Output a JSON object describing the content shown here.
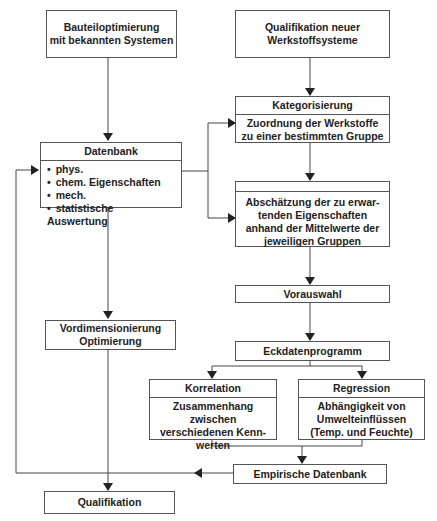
{
  "boxes": {
    "bauteil": {
      "lines": [
        "Bauteiloptimierung",
        "mit bekannten Systemen"
      ]
    },
    "qualifikation_neu": {
      "lines": [
        "Qualifikation neuer",
        "Werkstoffsysteme"
      ]
    },
    "kategorisierung": {
      "title": "Kategorisierung",
      "lines": [
        "Zuordnung der Werkstoffe",
        "zu einer bestimmten Gruppe"
      ]
    },
    "datenbank": {
      "title": "Datenbank",
      "items": [
        "phys.",
        "chem. Eigenschaften",
        "mech.",
        "statistische Auswertung"
      ]
    },
    "abschaetzung": {
      "title": "",
      "lines": [
        "Abschätzung der zu erwar-",
        "tenden Eigenschaften",
        "anhand der Mittelwerte der",
        "jeweiligen Gruppen"
      ]
    },
    "vorauswahl": {
      "label": "Vorauswahl"
    },
    "vordim": {
      "lines": [
        "Vordimensionierung",
        "Optimierung"
      ]
    },
    "eckdaten": {
      "label": "Eckdatenprogramm"
    },
    "korrelation": {
      "title": "Korrelation",
      "lines": [
        "Zusammenhang zwischen",
        "verschiedenen Kenn-",
        "werten"
      ]
    },
    "regression": {
      "title": "Regression",
      "lines": [
        "Abhängigkeit von",
        "Umwelteinflüssen",
        "(Temp. und Feuchte)"
      ]
    },
    "empirisch": {
      "label": "Empirische Datenbank"
    },
    "qualifikation": {
      "label": "Qualifikation"
    }
  }
}
